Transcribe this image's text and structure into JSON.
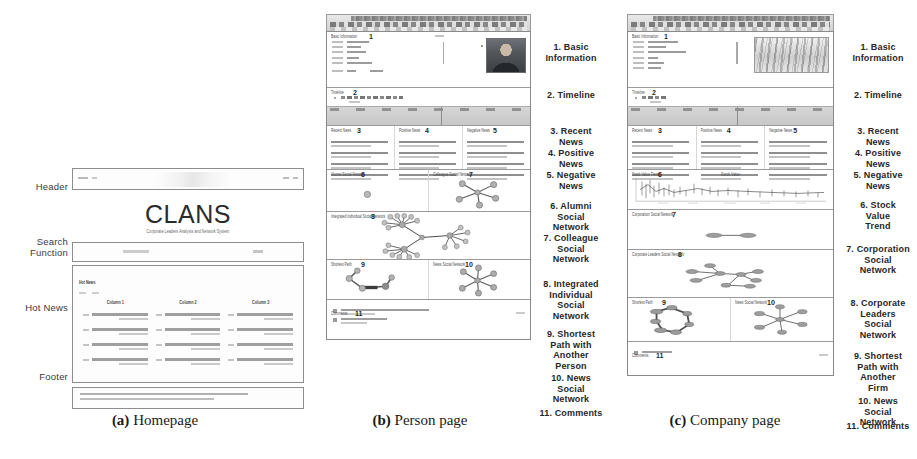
{
  "figure": {
    "captions": [
      {
        "tag": "(a)",
        "text": "Homepage"
      },
      {
        "tag": "(b)",
        "text": "Person page"
      },
      {
        "tag": "(c)",
        "text": "Company page"
      }
    ]
  },
  "homepage": {
    "brand": "CLANS",
    "subtitle": "Corporate Leaders Analysis and Network System",
    "section_labels": [
      "Header",
      "Search\nFunction",
      "Hot News",
      "Footer"
    ],
    "hot_news": {
      "tag": "Hot News",
      "columns": [
        "Column 1",
        "Column 2",
        "Column 3"
      ],
      "rows_per_column": 4
    }
  },
  "person_page": {
    "legend": [
      "1. Basic\nInformation",
      "2. Timeline",
      "3. Recent\nNews",
      "4. Positive\nNews",
      "5. Negative\nNews",
      "6. Alumni\nSocial\nNetwork",
      "7. Colleague\nSocial\nNetwork",
      "8. Integrated\nIndividual\nSocial\nNetwork",
      "9. Shortest\nPath with\nAnother\nPerson",
      "10. News\nSocial\nNetwork",
      "11. Comments"
    ],
    "section_numbers": [
      "1",
      "2",
      "3",
      "4",
      "5",
      "6",
      "7",
      "8",
      "9",
      "10",
      "11"
    ],
    "section_tags": [
      "Basic Information",
      "Timeline",
      "Recent News",
      "Positive News",
      "Negative News",
      "Alumni Social Network",
      "Colleague Social Network",
      "Integrated Individual Social Network",
      "Shortest Path",
      "News Social Network",
      "Comments"
    ]
  },
  "company_page": {
    "legend": [
      "1. Basic\nInformation",
      "2. Timeline",
      "3. Recent\nNews",
      "4. Positive\nNews",
      "5. Negative\nNews",
      "6. Stock\nValue\nTrend",
      "7. Corporation\nSocial\nNetwork",
      "8. Corporate\nLeaders\nSocial\nNetwork",
      "9. Shortest\nPath with\nAnother\nFirm",
      "10. News\nSocial\nNetwork",
      "11. Comments"
    ],
    "section_numbers": [
      "1",
      "2",
      "3",
      "4",
      "5",
      "6",
      "7",
      "8",
      "9",
      "10",
      "11"
    ],
    "section_tags": [
      "Basic Information",
      "Timeline",
      "Recent News",
      "Positive News",
      "Negative News",
      "Stock Value Trend",
      "Corporation Social Network",
      "Corporate Leaders Social Network",
      "Shortest Path",
      "News Social Network",
      "Comments"
    ],
    "stock_chart_title": "Stock Value"
  },
  "colors": {
    "node_fill": "#b9b9b9",
    "node_stroke": "#6f6f6f",
    "edge": "#6e6e6e",
    "panel_border": "#8a8a8a",
    "timeline_band": "#cfcfcf"
  }
}
